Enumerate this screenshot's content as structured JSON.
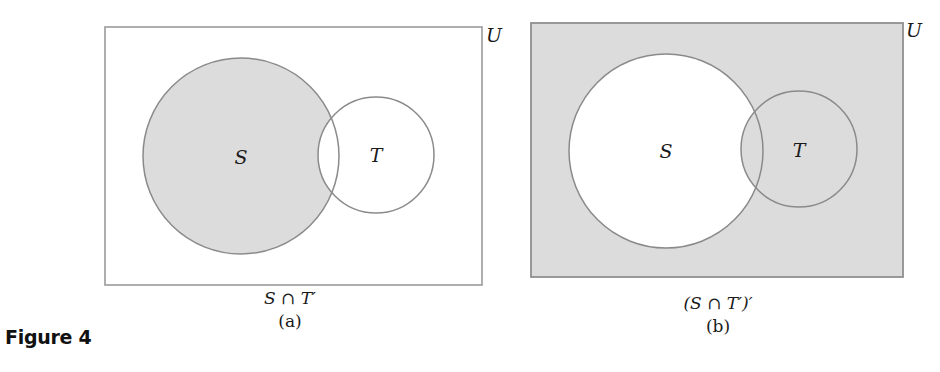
{
  "figure": {
    "label": "Figure 4",
    "universe_label": "U",
    "colors": {
      "shade": "#dcdcdc",
      "outline": "#8a8a8a",
      "background": "#ffffff",
      "text": "#1a1a1a"
    }
  },
  "panels": [
    {
      "id": "a",
      "expression": "S ∩ T′",
      "sublabel": "(a)",
      "universe": {
        "label": "U",
        "shaded": false
      },
      "sets": [
        {
          "label": "S",
          "shaded": true
        },
        {
          "label": "T",
          "shaded": false
        }
      ],
      "shaded_region": "S minus T (part of S outside T)"
    },
    {
      "id": "b",
      "expression": "(S ∩ T′)′",
      "sublabel": "(b)",
      "universe": {
        "label": "U",
        "shaded": true
      },
      "sets": [
        {
          "label": "S",
          "shaded": false
        },
        {
          "label": "T",
          "shaded": true
        }
      ],
      "shaded_region": "Everything except S minus T (complement of S ∩ T′)"
    }
  ]
}
